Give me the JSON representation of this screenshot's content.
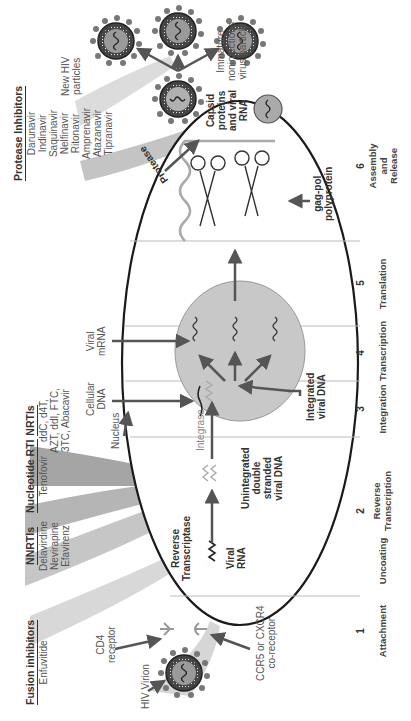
{
  "drug_classes": [
    {
      "name": "Fusion inhibitors",
      "drugs": [
        "Enfuvitide"
      ]
    },
    {
      "name": "NNRTIs",
      "drugs": [
        "Delavirdine",
        "Nevirapine",
        "Efavirenz"
      ]
    },
    {
      "name": "Nucleotide RTI",
      "drugs": [
        "Tenofovir"
      ]
    },
    {
      "name": "NRTIs",
      "drugs": [
        "ddC, d4T,",
        "AZT, ddI, FTC,",
        "3TC, Abacavir"
      ]
    },
    {
      "name": "Protease Inhibitors",
      "drugs": [
        "Darunavir",
        "Indinavir",
        "Saquinavir",
        "Nelfinavir",
        "Ritonavir",
        "Amprenavir",
        "Atazanavir",
        "Tipranavir"
      ]
    }
  ],
  "labels": {
    "hiv_virion": "HIV Virion",
    "cd4_receptor": [
      "CD4",
      "receptor"
    ],
    "coreceptor": [
      "CCR5 or CXCR4",
      "co-receptor"
    ],
    "reverse_transcriptase": [
      "Reverse",
      "Transcriptase"
    ],
    "viral_rna": [
      "Viral",
      "RNA"
    ],
    "unintegrated_dna": [
      "Unintegrated",
      "double",
      "stranded",
      "viral DNA"
    ],
    "integrase": "Integrase",
    "nucleus": "Nucleus",
    "cellular_dna": [
      "Cellular",
      "DNA"
    ],
    "viral_mrna": [
      "Viral",
      "mRNA"
    ],
    "integrated_dna": [
      "Integrated",
      "viral DNA"
    ],
    "gag_pol": [
      "gag-pol",
      "polyprotein"
    ],
    "protease": "Protease",
    "capsid": [
      "Capsid",
      "proteins",
      "and viral",
      "RNA"
    ],
    "immature": [
      "Immature",
      "noninfectious",
      "virus particle"
    ],
    "new_hiv": [
      "New HIV",
      "particles"
    ]
  },
  "stages": [
    {
      "num": "1",
      "name": [
        "Attachment"
      ]
    },
    {
      "num": "",
      "name": [
        "Uncoating"
      ]
    },
    {
      "num": "2",
      "name": [
        "Reverse",
        "Transcription"
      ]
    },
    {
      "num": "3",
      "name": [
        "Integration"
      ]
    },
    {
      "num": "4",
      "name": [
        "Transcription"
      ]
    },
    {
      "num": "5",
      "name": [
        "Translation"
      ]
    },
    {
      "num": "6",
      "name": [
        "Assembly",
        "and",
        "Release"
      ]
    }
  ],
  "colors": {
    "ellipse_stroke": "#1a1a1a",
    "nucleus_fill": "#c8c8c8",
    "arrow": "#555555",
    "drug_fan_light": "#d6d6d6",
    "drug_fan_dark": "#a9a9a9"
  }
}
